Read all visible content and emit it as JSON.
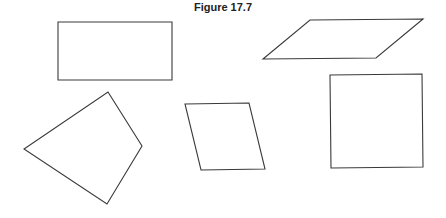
{
  "figure": {
    "title": "Figure 17.7",
    "shapes": [
      {
        "name": "rectangle",
        "kind": "rectangle"
      },
      {
        "name": "parallelogram",
        "kind": "parallelogram"
      },
      {
        "name": "kite-quadrilateral",
        "kind": "quadrilateral"
      },
      {
        "name": "rhombus",
        "kind": "rhombus"
      },
      {
        "name": "square",
        "kind": "square"
      }
    ]
  }
}
